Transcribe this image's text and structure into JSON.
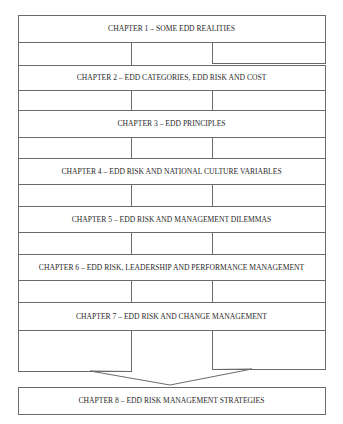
{
  "diagram": {
    "type": "flow",
    "direction": "top-to-bottom",
    "colors": {
      "stroke": "#6b6b6b",
      "text": "#2a2a2a",
      "background": "#ffffff"
    },
    "chapters": [
      {
        "id": 1,
        "label": "CHAPTER 1 – SOME EDD REALITIES",
        "x": 18,
        "y": 15,
        "w": 307,
        "h": 27
      },
      {
        "id": 2,
        "label": "CHAPTER 2 – EDD CATEGORIES, EDD RISK AND COST",
        "x": 18,
        "y": 65,
        "w": 307,
        "h": 25
      },
      {
        "id": 3,
        "label": "CHAPTER 3 – EDD PRINCIPLES",
        "x": 18,
        "y": 110,
        "w": 307,
        "h": 27
      },
      {
        "id": 4,
        "label": "CHAPTER 4 – EDD RISK AND NATIONAL CULTURE VARIABLES",
        "x": 18,
        "y": 158,
        "w": 307,
        "h": 26
      },
      {
        "id": 5,
        "label": "CHAPTER 5 – EDD RISK AND MANAGEMENT DILEMMAS",
        "x": 18,
        "y": 206,
        "w": 307,
        "h": 26
      },
      {
        "id": 6,
        "label": "CHAPTER 6 – EDD RISK, LEADERSHIP AND PERFORMANCE MANAGEMENT",
        "x": 18,
        "y": 254,
        "w": 307,
        "h": 26
      },
      {
        "id": 7,
        "label": "CHAPTER 7 – EDD RISK AND CHANGE MANAGEMENT",
        "x": 18,
        "y": 302,
        "w": 307,
        "h": 28
      },
      {
        "id": 8,
        "label": "CHAPTER 8 – EDD RISK MANAGEMENT STRATEGIES",
        "x": 18,
        "y": 387,
        "w": 307,
        "h": 27
      }
    ],
    "connectors": [
      {
        "from": 1,
        "to": 2,
        "left": {
          "x": 18,
          "y": 42,
          "w": 113,
          "h": 23
        },
        "right": {
          "x": 212,
          "y": 40,
          "w": 113,
          "h": 23
        }
      },
      {
        "from": 2,
        "to": 3,
        "left": {
          "x": 18,
          "y": 90,
          "w": 113,
          "h": 21
        },
        "right": {
          "x": 212,
          "y": 87,
          "w": 113,
          "h": 23
        }
      },
      {
        "from": 3,
        "to": 4,
        "left": {
          "x": 18,
          "y": 137,
          "w": 113,
          "h": 21
        },
        "right": {
          "x": 212,
          "y": 134,
          "w": 113,
          "h": 24
        }
      },
      {
        "from": 4,
        "to": 5,
        "left": {
          "x": 18,
          "y": 184,
          "w": 113,
          "h": 22
        },
        "right": {
          "x": 212,
          "y": 182,
          "w": 113,
          "h": 24
        }
      },
      {
        "from": 5,
        "to": 6,
        "left": {
          "x": 18,
          "y": 232,
          "w": 113,
          "h": 22
        },
        "right": {
          "x": 212,
          "y": 230,
          "w": 113,
          "h": 24
        }
      },
      {
        "from": 6,
        "to": 7,
        "left": {
          "x": 18,
          "y": 280,
          "w": 113,
          "h": 22
        },
        "right": {
          "x": 212,
          "y": 278,
          "w": 113,
          "h": 24
        }
      }
    ],
    "final_arrow": {
      "from": 7,
      "to": 8,
      "left_shaft": {
        "x1": 131,
        "y_top": 330,
        "y_bottom": 371
      },
      "right_shaft": {
        "x1": 212,
        "y_top": 328,
        "y_bottom": 369
      },
      "head_left": {
        "x": 90,
        "y": 371
      },
      "head_right": {
        "x": 252,
        "y": 369
      },
      "tip": {
        "x": 170,
        "y": 385
      }
    }
  }
}
